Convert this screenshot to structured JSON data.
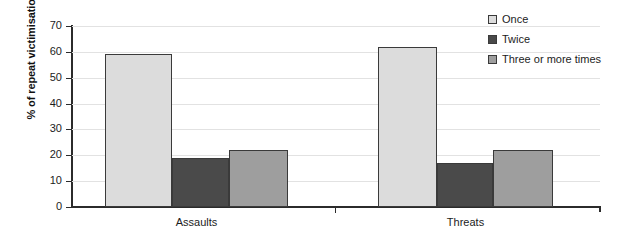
{
  "chart_data": {
    "type": "bar",
    "title": "",
    "subtitle": "",
    "xlabel": "",
    "ylabel": "% of repeat victimisation",
    "categories": [
      "Assaults",
      "Threats"
    ],
    "series": [
      {
        "name": "Once",
        "values": [
          59,
          62
        ],
        "color": "#dcdcdc"
      },
      {
        "name": "Twice",
        "values": [
          19,
          17
        ],
        "color": "#4a4a4a"
      },
      {
        "name": "Three or more times",
        "values": [
          22,
          22
        ],
        "color": "#9e9e9e"
      }
    ],
    "ylim": [
      0,
      70
    ],
    "ytick_step": 10,
    "yticks": [
      "70",
      "60",
      "50",
      "40",
      "30",
      "20",
      "10",
      "0"
    ],
    "grid": true,
    "grid_axis": "y",
    "legend_position": "top-right"
  },
  "colors": {
    "background": "#ffffff",
    "axis": "#2b2b2b",
    "grid": "#e2e2e2",
    "text": "#1c1c1c",
    "bar_border": "#3a3a3a"
  }
}
